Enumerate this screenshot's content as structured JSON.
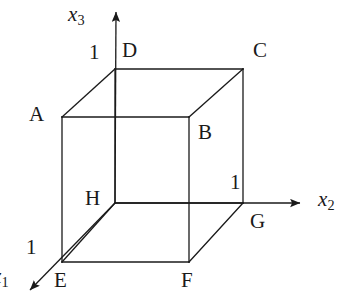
{
  "figure": {
    "stroke_color": "#1a1a1a",
    "background_color": "#ffffff",
    "line_width": 1.3
  },
  "axes": [
    {
      "id": "x1",
      "name": "x1-axis",
      "base": "x",
      "subscript": "1",
      "label_x": 0,
      "label_y": 266,
      "clipped_at_left_edge": true,
      "from": [
        115,
        203
      ],
      "to": [
        30,
        290
      ],
      "arrow": true
    },
    {
      "id": "x2",
      "name": "x2-axis",
      "base": "x",
      "subscript": "2",
      "label_x": 318,
      "label_y": 189,
      "clipped_at_left_edge": false,
      "from": [
        115,
        203
      ],
      "to": [
        300,
        203
      ],
      "arrow": true
    },
    {
      "id": "x3",
      "name": "x3-axis",
      "base": "x",
      "subscript": "3",
      "label_x": 68,
      "label_y": 4,
      "clipped_at_left_edge": false,
      "from": [
        115,
        203
      ],
      "to": [
        116,
        12
      ],
      "arrow": true
    }
  ],
  "ticks": [
    {
      "id": "tick-x3",
      "label": "1",
      "x": 89,
      "y": 42,
      "axis": "x3"
    },
    {
      "id": "tick-x2",
      "label": "1",
      "x": 230,
      "y": 172,
      "axis": "x2"
    },
    {
      "id": "tick-x1",
      "label": "1",
      "x": 26,
      "y": 237,
      "axis": "x1"
    }
  ],
  "vertices": [
    {
      "id": "A",
      "label": "A",
      "point": [
        62,
        117
      ],
      "label_x": 29,
      "label_y": 104
    },
    {
      "id": "B",
      "label": "B",
      "point": [
        189,
        117
      ],
      "label_x": 198,
      "label_y": 122
    },
    {
      "id": "C",
      "label": "C",
      "point": [
        243,
        69
      ],
      "label_x": 253,
      "label_y": 40
    },
    {
      "id": "D",
      "label": "D",
      "point": [
        115,
        69
      ],
      "label_x": 122,
      "label_y": 40
    },
    {
      "id": "E",
      "label": "E",
      "point": [
        62,
        262
      ],
      "label_x": 54,
      "label_y": 270
    },
    {
      "id": "F",
      "label": "F",
      "point": [
        189,
        262
      ],
      "label_x": 181,
      "label_y": 270
    },
    {
      "id": "G",
      "label": "G",
      "point": [
        243,
        203
      ],
      "label_x": 250,
      "label_y": 211
    },
    {
      "id": "H",
      "label": "H",
      "point": [
        115,
        203
      ],
      "label_x": 85,
      "label_y": 188
    }
  ],
  "edges": [
    {
      "id": "edge-AB",
      "name": "edge-a-b",
      "from": [
        62,
        117
      ],
      "to": [
        189,
        117
      ]
    },
    {
      "id": "edge-BC",
      "name": "edge-b-c",
      "from": [
        189,
        117
      ],
      "to": [
        243,
        69
      ]
    },
    {
      "id": "edge-CD",
      "name": "edge-c-d",
      "from": [
        243,
        69
      ],
      "to": [
        115,
        69
      ]
    },
    {
      "id": "edge-DA",
      "name": "edge-d-a",
      "from": [
        115,
        69
      ],
      "to": [
        62,
        117
      ]
    },
    {
      "id": "edge-EF",
      "name": "edge-e-f",
      "from": [
        62,
        262
      ],
      "to": [
        189,
        262
      ]
    },
    {
      "id": "edge-FG",
      "name": "edge-f-g",
      "from": [
        189,
        262
      ],
      "to": [
        243,
        203
      ]
    },
    {
      "id": "edge-GH",
      "name": "edge-g-h",
      "from": [
        243,
        203
      ],
      "to": [
        115,
        203
      ]
    },
    {
      "id": "edge-HE",
      "name": "edge-h-e",
      "from": [
        115,
        203
      ],
      "to": [
        62,
        262
      ]
    },
    {
      "id": "edge-AE",
      "name": "edge-a-e",
      "from": [
        62,
        117
      ],
      "to": [
        62,
        262
      ]
    },
    {
      "id": "edge-BF",
      "name": "edge-b-f",
      "from": [
        189,
        117
      ],
      "to": [
        189,
        262
      ]
    },
    {
      "id": "edge-CG",
      "name": "edge-c-g",
      "from": [
        243,
        69
      ],
      "to": [
        243,
        203
      ]
    },
    {
      "id": "edge-DH",
      "name": "edge-d-h",
      "from": [
        115,
        69
      ],
      "to": [
        115,
        203
      ]
    }
  ]
}
